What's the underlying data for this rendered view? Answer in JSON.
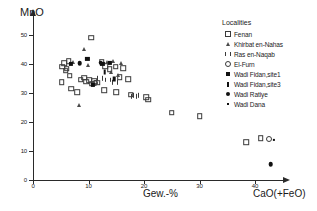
{
  "chart_data": {
    "type": "scatter",
    "title": "",
    "xlabel": "CaO(+FeO)",
    "x_unit_label": "Gew.-%",
    "ylabel": "MnO",
    "xlim": [
      0,
      45
    ],
    "ylim": [
      0,
      52
    ],
    "x_ticks": [
      0,
      10,
      20,
      30,
      40
    ],
    "y_ticks": [
      0,
      10,
      20,
      30,
      40,
      50
    ],
    "x_tick_labels": [
      "0",
      "10",
      "20",
      "30",
      "40"
    ],
    "y_tick_labels": [
      "0",
      "10",
      "20",
      "30",
      "40",
      "50"
    ],
    "grid": false,
    "legend_position": "top-right",
    "legend_title": "Localities",
    "series": [
      {
        "name": "Fenan",
        "marker": "square-open",
        "points": [
          [
            10.5,
            49.0
          ],
          [
            5.6,
            40.3
          ],
          [
            6.4,
            41.0
          ],
          [
            5.3,
            39.0
          ],
          [
            6.1,
            38.4
          ],
          [
            5.9,
            37.6
          ],
          [
            6.6,
            35.9
          ],
          [
            5.2,
            33.7
          ],
          [
            6.9,
            31.4
          ],
          [
            8.0,
            30.3
          ],
          [
            8.6,
            34.6
          ],
          [
            9.2,
            35.2
          ],
          [
            9.6,
            33.9
          ],
          [
            10.1,
            34.4
          ],
          [
            10.6,
            33.2
          ],
          [
            11.0,
            34.0
          ],
          [
            11.6,
            33.5
          ],
          [
            12.4,
            40.8
          ],
          [
            13.0,
            39.3
          ],
          [
            13.8,
            38.1
          ],
          [
            14.9,
            39.0
          ],
          [
            16.3,
            38.6
          ],
          [
            15.6,
            35.4
          ],
          [
            17.2,
            34.7
          ],
          [
            12.8,
            30.8
          ],
          [
            15.0,
            30.2
          ],
          [
            17.6,
            29.4
          ],
          [
            20.4,
            28.4
          ],
          [
            20.8,
            27.6
          ],
          [
            25.0,
            23.1
          ],
          [
            30.0,
            21.8
          ],
          [
            38.4,
            13.0
          ],
          [
            41.0,
            14.2
          ]
        ]
      },
      {
        "name": "Khirbat en-Nahas",
        "marker": "triangle-open",
        "points": [
          [
            9.1,
            45.2
          ],
          [
            7.2,
            40.5
          ],
          [
            9.9,
            39.6
          ],
          [
            13.4,
            40.6
          ],
          [
            14.4,
            40.9
          ],
          [
            15.9,
            40.2
          ],
          [
            14.1,
            37.2
          ],
          [
            15.4,
            36.0
          ],
          [
            8.3,
            25.8
          ]
        ]
      },
      {
        "name": "Ras en-Naqab",
        "marker": "bars-open",
        "points": [
          [
            12.0,
            35.0
          ],
          [
            13.6,
            34.4
          ],
          [
            14.8,
            33.6
          ],
          [
            18.6,
            29.2
          ],
          [
            18.2,
            28.8
          ]
        ]
      },
      {
        "name": "El-Furn",
        "marker": "circle-open",
        "points": [
          [
            11.2,
            33.4
          ],
          [
            42.5,
            14.0
          ]
        ]
      },
      {
        "name": "Wadi Fidan,site1",
        "marker": "square-filled",
        "points": [
          [
            6.8,
            40.0
          ],
          [
            9.8,
            41.6
          ],
          [
            12.5,
            40.1
          ],
          [
            13.9,
            40.3
          ],
          [
            10.8,
            32.6
          ]
        ]
      },
      {
        "name": "Wadi Fidan,site3",
        "marker": "bar-filled",
        "points": [
          [
            14.6,
            34.9
          ],
          [
            12.9,
            37.3
          ]
        ]
      },
      {
        "name": "Wadi Ratiye",
        "marker": "circle-filled",
        "points": [
          [
            8.4,
            40.2
          ],
          [
            12.2,
            40.4
          ],
          [
            42.8,
            5.2
          ]
        ]
      },
      {
        "name": "Wadi Dana",
        "marker": "dot-filled",
        "points": [
          [
            43.4,
            13.6
          ]
        ]
      }
    ]
  }
}
